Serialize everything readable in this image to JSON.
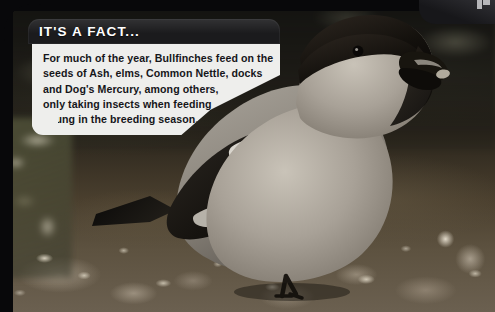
{
  "page": {
    "width": 495,
    "height": 312
  },
  "photo": {
    "subject": "Bullfinch perched on bare ground",
    "alt_text": "A male bullfinch with black cap, black bill and pale grey breast standing on dark mottled soil scattered with pale stones and twigs.",
    "colors": {
      "bird_cap": "#171310",
      "bird_bill": "#14110e",
      "bird_breast": "#a9a196",
      "bird_back": "#8c867d",
      "bird_wing": "#1b1815",
      "wing_bar": "#e8e4dc",
      "ground": "#4a3f2e",
      "background_dark": "#22201a"
    }
  },
  "frame": {
    "color": "#08080a",
    "corner_tab_color": "#17171a",
    "corner_mark": "corner-logo-mark"
  },
  "callout": {
    "title": "IT'S A FACT...",
    "title_color": "#ffffff",
    "header_color": "#1b1b1d",
    "body_color": "#eeeeec",
    "text_color": "#16161a",
    "lines": [
      "For much of the year, Bullfinches feed on the",
      "seeds of Ash, elms, Common Nettle, docks",
      "and Dog's Mercury, among others,",
      "only taking insects when feeding",
      "young in the breeding season."
    ]
  }
}
